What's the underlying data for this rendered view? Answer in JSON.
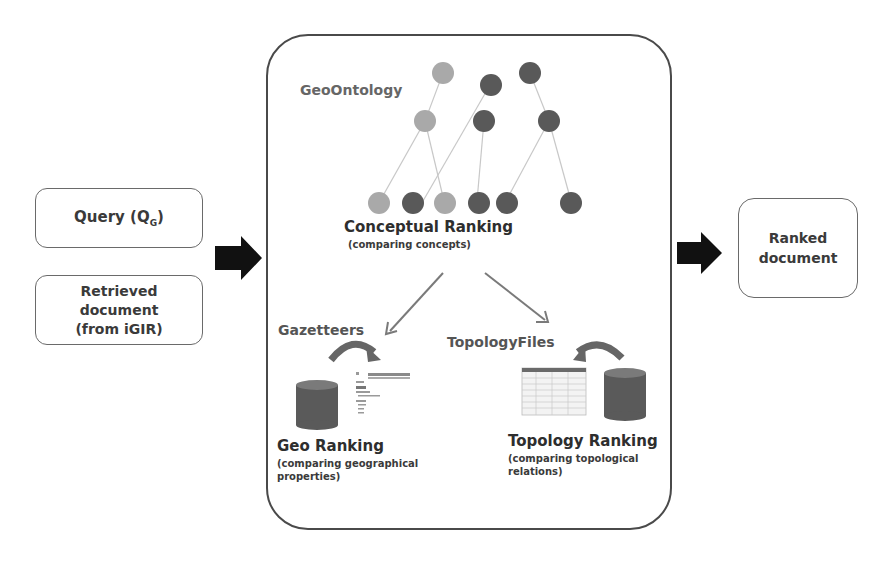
{
  "inputs": {
    "query": {
      "label": "Query (Q",
      "subscript": "G",
      "suffix": ")"
    },
    "retrieved_document": {
      "lines": [
        "Retrieved",
        "document",
        "(from iGIR)"
      ]
    }
  },
  "output": {
    "lines": [
      "Ranked",
      "document"
    ]
  },
  "process": {
    "ontology_label": "GeoOntology",
    "conceptual": {
      "title": "Conceptual Ranking",
      "subtitle": "(comparing concepts)"
    },
    "gazetteers_label": "Gazetteers",
    "topology_files_label": "TopologyFiles",
    "geo": {
      "title": "Geo Ranking",
      "subtitle_lines": [
        "(comparing geographical",
        "properties)"
      ]
    },
    "topology": {
      "title": "Topology Ranking",
      "subtitle_lines": [
        "(comparing topological",
        "relations)"
      ]
    }
  },
  "colors": {
    "node_light": "#a9a9a9",
    "node_dark": "#595959",
    "edge": "#c8c8c8",
    "arrow_dark": "#111111",
    "arrow_gray": "#7a7a7a",
    "cylinder": "#5a5a5a",
    "curve_arrow": "#666666"
  }
}
